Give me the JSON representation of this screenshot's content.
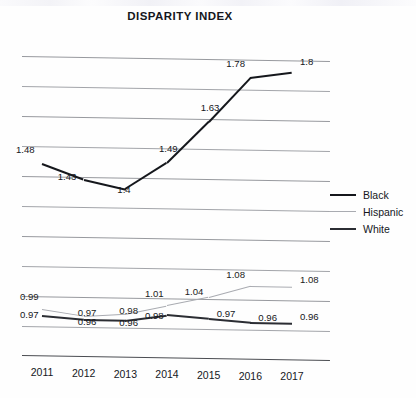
{
  "chart_data": {
    "type": "line",
    "title": "DISPARITY INDEX",
    "xlabel": "",
    "ylabel": "",
    "categories": [
      "2011",
      "2012",
      "2013",
      "2014",
      "2015",
      "2016",
      "2017"
    ],
    "series": [
      {
        "name": "Black",
        "color": "#15171c",
        "values": [
          1.48,
          1.43,
          1.4,
          1.49,
          1.63,
          1.78,
          1.8
        ],
        "labels": [
          "1.48",
          "1.43",
          "1.4",
          "1.49",
          "1.63",
          "1.78",
          "1.8"
        ]
      },
      {
        "name": "Hispanic",
        "color": "#a9abb1",
        "values": [
          0.99,
          0.97,
          0.98,
          1.01,
          1.04,
          1.08,
          1.08
        ],
        "labels": [
          "0.99",
          "0.97",
          "0.98",
          "1.01",
          "1.04",
          "1.08",
          "1.08"
        ]
      },
      {
        "name": "White",
        "color": "#2b2d33",
        "values": [
          0.97,
          0.96,
          0.96,
          0.98,
          0.97,
          0.96,
          0.96
        ],
        "labels": [
          "0.97",
          "0.96",
          "0.96",
          "0.98",
          "0.97",
          "0.96",
          "0.96"
        ]
      }
    ],
    "ylim": [
      0.8,
      2.0
    ],
    "grid": true,
    "gridlines": 10,
    "legend_position": "right",
    "legend": [
      "Black",
      "Hispanic",
      "White"
    ],
    "data_labels_shown": true
  },
  "legend": {
    "items": [
      {
        "label": "Black"
      },
      {
        "label": "Hispanic"
      },
      {
        "label": "White"
      }
    ]
  },
  "axis": {
    "x_ticks": [
      "2011",
      "2012",
      "2013",
      "2014",
      "2015",
      "2016",
      "2017"
    ]
  }
}
